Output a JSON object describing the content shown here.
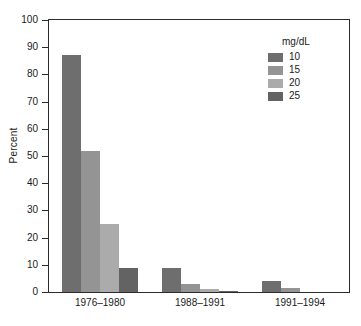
{
  "chart_data": {
    "type": "bar",
    "title": "",
    "xlabel": "",
    "ylabel": "Percent",
    "ylim": [
      0,
      100
    ],
    "ytick_step": 10,
    "grid": false,
    "legend_position": "top-right-inside",
    "legend_title": "mg/dL",
    "categories": [
      "1976–1980",
      "1988–1991",
      "1991–1994"
    ],
    "yticks": [
      "0",
      "10",
      "20",
      "30",
      "40",
      "50",
      "60",
      "70",
      "80",
      "90",
      "100"
    ],
    "series": [
      {
        "name": "10",
        "color": "#6e6e6e",
        "values": [
          87,
          9,
          4
        ]
      },
      {
        "name": "15",
        "color": "#949494",
        "values": [
          52,
          3,
          1.5
        ]
      },
      {
        "name": "20",
        "color": "#ababab",
        "values": [
          25,
          1,
          0
        ]
      },
      {
        "name": "25",
        "color": "#636363",
        "values": [
          9,
          0.3,
          0
        ]
      }
    ]
  }
}
